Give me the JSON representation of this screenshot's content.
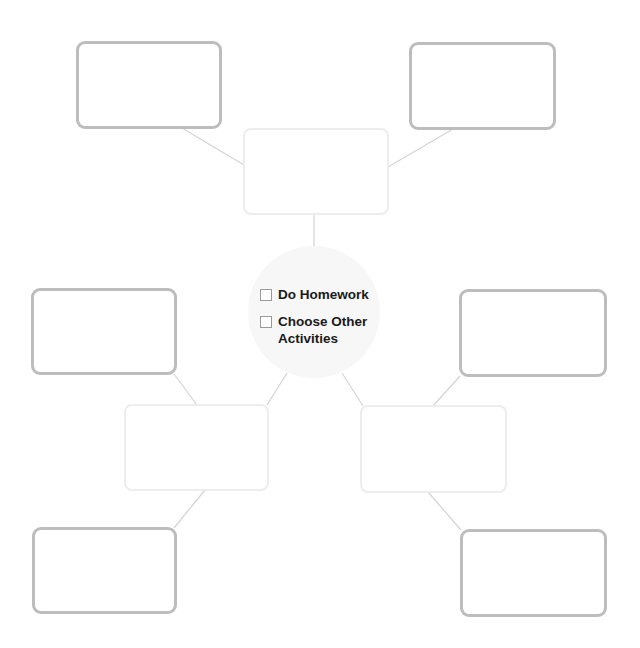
{
  "diagram": {
    "type": "web-organizer",
    "colors": {
      "outer_box_border": "#bdbdbd",
      "inner_box_border": "#ededed",
      "connector": "#d4d4d4",
      "hub_fill": "#f7f7f7",
      "text": "#1a1a1a"
    },
    "hub": {
      "options": [
        {
          "label": "Do Homework",
          "checked": false
        },
        {
          "label": "Choose Other Activities",
          "checked": false
        }
      ]
    },
    "boxes": [
      {
        "id": "top-center",
        "style": "light",
        "text": ""
      },
      {
        "id": "top-left",
        "style": "dark",
        "text": ""
      },
      {
        "id": "top-right",
        "style": "dark",
        "text": ""
      },
      {
        "id": "left-middle",
        "style": "light",
        "text": ""
      },
      {
        "id": "left-upper",
        "style": "dark",
        "text": ""
      },
      {
        "id": "left-lower",
        "style": "dark",
        "text": ""
      },
      {
        "id": "right-middle",
        "style": "light",
        "text": ""
      },
      {
        "id": "right-upper",
        "style": "dark",
        "text": ""
      },
      {
        "id": "right-lower",
        "style": "dark",
        "text": ""
      }
    ]
  }
}
